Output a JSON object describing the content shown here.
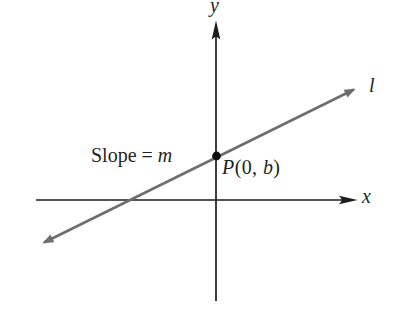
{
  "labels": {
    "y_axis": "y",
    "x_axis": "x",
    "line": "l",
    "slope_prefix": "Slope = ",
    "slope_var": "m",
    "point_p": "P",
    "point_mid": "(0, ",
    "point_b": "b",
    "point_close": ")"
  },
  "colors": {
    "background": "#ffffff",
    "axis": "#1c1c1c",
    "line": "#6e6e6e",
    "point": "#0d0d0d",
    "text": "#1f1f1f"
  }
}
